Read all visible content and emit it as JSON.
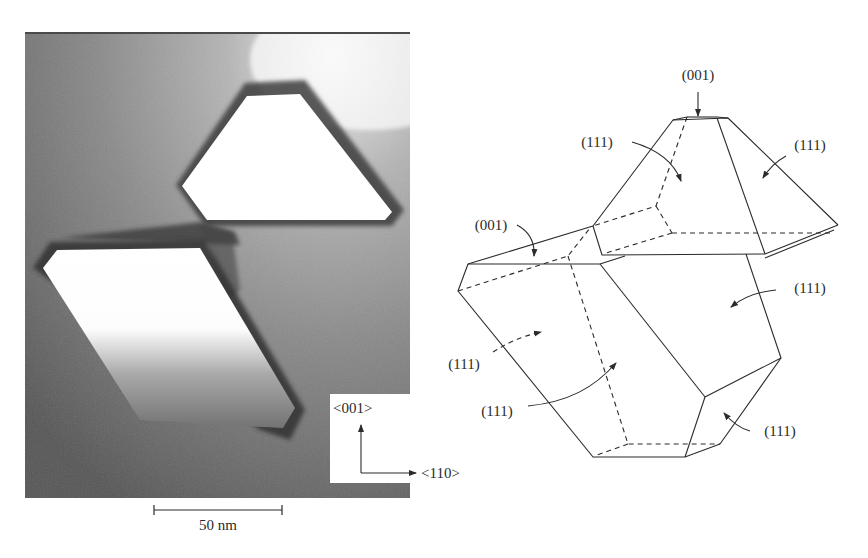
{
  "micrograph": {
    "scale_bar": {
      "label": "50 nm"
    },
    "axes": {
      "vertical_label": "<001>",
      "horizontal_label": "<110>"
    },
    "colors": {
      "background_dark": "#6e6e6e",
      "background_light": "#b9b9b9",
      "particle_interior": "#ffffff",
      "particle_rim": "#3a3a3a"
    }
  },
  "schematic": {
    "labels": {
      "top_001": "(001)",
      "upper_left_111": "(111)",
      "upper_right_111": "(111)",
      "left_001": "(001)",
      "middle_right_111": "(111)",
      "left_hidden_111": "(111)",
      "lower_left_111": "(111)",
      "bottom_right_111": "(111)"
    },
    "colors": {
      "line": "#2b2b2b"
    }
  }
}
